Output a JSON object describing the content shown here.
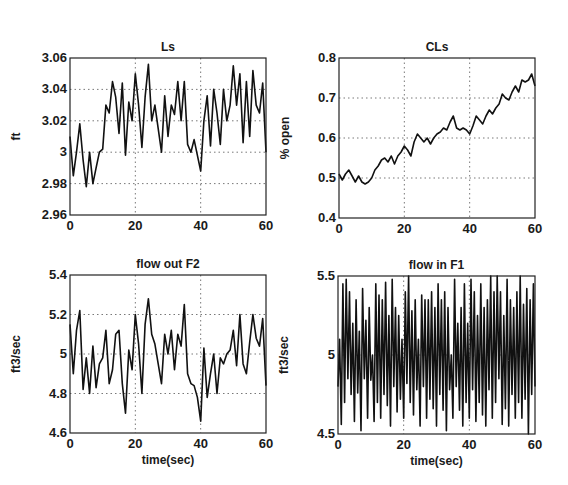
{
  "chart_data": [
    {
      "id": "ls",
      "type": "line",
      "title": "Ls",
      "xlabel": "",
      "ylabel": "ft",
      "xlim": [
        0,
        60
      ],
      "ylim": [
        2.96,
        3.06
      ],
      "xticks": [
        0,
        20,
        40,
        60
      ],
      "yticks": [
        2.96,
        2.98,
        3.0,
        3.02,
        3.04,
        3.06
      ],
      "ytick_labels": [
        "2.96",
        "2.98",
        "3",
        "3.02",
        "3.04",
        "3.06"
      ],
      "grid": true,
      "box": {
        "x": 70,
        "y": 58,
        "w": 196,
        "h": 157
      },
      "x": [
        0,
        1,
        2,
        3,
        4,
        5,
        6,
        7,
        8,
        9,
        10,
        11,
        12,
        13,
        14,
        15,
        16,
        17,
        18,
        19,
        20,
        21,
        22,
        23,
        24,
        25,
        26,
        27,
        28,
        29,
        30,
        31,
        32,
        33,
        34,
        35,
        36,
        37,
        38,
        39,
        40,
        41,
        42,
        43,
        44,
        45,
        46,
        47,
        48,
        49,
        50,
        51,
        52,
        53,
        54,
        55,
        56,
        57,
        58,
        59,
        60
      ],
      "series": [
        {
          "name": "Ls",
          "values": [
            3.01,
            2.985,
            3.0,
            3.018,
            2.995,
            2.978,
            3.0,
            2.98,
            2.99,
            3.0,
            3.002,
            3.03,
            3.025,
            3.045,
            3.035,
            3.012,
            3.044,
            2.998,
            3.032,
            3.02,
            3.05,
            3.03,
            3.003,
            3.035,
            3.056,
            3.02,
            3.03,
            3.015,
            3.0,
            3.036,
            3.01,
            3.03,
            3.024,
            3.045,
            3.02,
            3.045,
            3.005,
            3.0,
            3.008,
            2.998,
            2.988,
            3.02,
            3.036,
            3.004,
            3.04,
            3.025,
            3.005,
            3.04,
            3.02,
            3.03,
            3.055,
            3.03,
            3.05,
            3.006,
            3.045,
            3.01,
            3.052,
            3.03,
            3.025,
            3.044,
            3.0
          ]
        }
      ]
    },
    {
      "id": "cls",
      "type": "line",
      "title": "CLs",
      "xlabel": "",
      "ylabel": "% open",
      "xlim": [
        0,
        60
      ],
      "ylim": [
        0.4,
        0.8
      ],
      "xticks": [
        0,
        20,
        40,
        60
      ],
      "yticks": [
        0.4,
        0.5,
        0.6,
        0.7,
        0.8
      ],
      "ytick_labels": [
        "0.4",
        "0.5",
        "0.6",
        "0.7",
        "0.8"
      ],
      "grid": true,
      "box": {
        "x": 339,
        "y": 58,
        "w": 196,
        "h": 160
      },
      "x": [
        0,
        1,
        2,
        3,
        4,
        5,
        6,
        7,
        8,
        9,
        10,
        11,
        12,
        13,
        14,
        15,
        16,
        17,
        18,
        19,
        20,
        21,
        22,
        23,
        24,
        25,
        26,
        27,
        28,
        29,
        30,
        31,
        32,
        33,
        34,
        35,
        36,
        37,
        38,
        39,
        40,
        41,
        42,
        43,
        44,
        45,
        46,
        47,
        48,
        49,
        50,
        51,
        52,
        53,
        54,
        55,
        56,
        57,
        58,
        59,
        60
      ],
      "series": [
        {
          "name": "CLs",
          "values": [
            0.51,
            0.495,
            0.51,
            0.52,
            0.505,
            0.49,
            0.505,
            0.49,
            0.485,
            0.49,
            0.5,
            0.52,
            0.53,
            0.545,
            0.55,
            0.54,
            0.555,
            0.535,
            0.555,
            0.565,
            0.58,
            0.57,
            0.555,
            0.59,
            0.61,
            0.6,
            0.59,
            0.6,
            0.585,
            0.6,
            0.61,
            0.615,
            0.625,
            0.62,
            0.64,
            0.655,
            0.625,
            0.62,
            0.625,
            0.62,
            0.61,
            0.63,
            0.655,
            0.645,
            0.635,
            0.655,
            0.67,
            0.66,
            0.675,
            0.685,
            0.71,
            0.7,
            0.695,
            0.715,
            0.73,
            0.715,
            0.745,
            0.74,
            0.745,
            0.76,
            0.73
          ]
        }
      ]
    },
    {
      "id": "flow_out_f2",
      "type": "line",
      "title": "flow out F2",
      "xlabel": "time(sec)",
      "ylabel": "ft3/sec",
      "xlim": [
        0,
        60
      ],
      "ylim": [
        4.6,
        5.4
      ],
      "xticks": [
        0,
        20,
        40,
        60
      ],
      "yticks": [
        4.6,
        4.8,
        5.0,
        5.2,
        5.4
      ],
      "ytick_labels": [
        "4.6",
        "4.8",
        "5",
        "5.2",
        "5.4"
      ],
      "grid": true,
      "box": {
        "x": 70,
        "y": 275,
        "w": 196,
        "h": 158
      },
      "x": [
        0,
        1,
        2,
        3,
        4,
        5,
        6,
        7,
        8,
        9,
        10,
        11,
        12,
        13,
        14,
        15,
        16,
        17,
        18,
        19,
        20,
        21,
        22,
        23,
        24,
        25,
        26,
        27,
        28,
        29,
        30,
        31,
        32,
        33,
        34,
        35,
        36,
        37,
        38,
        39,
        40,
        41,
        42,
        43,
        44,
        45,
        46,
        47,
        48,
        49,
        50,
        51,
        52,
        53,
        54,
        55,
        56,
        57,
        58,
        59,
        60
      ],
      "series": [
        {
          "name": "flow out F2",
          "values": [
            5.15,
            4.9,
            5.12,
            5.22,
            4.82,
            4.98,
            4.8,
            5.04,
            4.83,
            4.95,
            4.98,
            5.12,
            4.85,
            4.92,
            5.1,
            5.12,
            4.85,
            4.7,
            5.02,
            4.92,
            5.2,
            5.05,
            4.8,
            5.15,
            5.28,
            5.1,
            5.05,
            4.95,
            4.85,
            5.1,
            5.0,
            5.12,
            4.92,
            5.1,
            5.04,
            5.25,
            4.9,
            4.85,
            4.84,
            4.78,
            4.66,
            5.03,
            4.78,
            4.9,
            5.0,
            4.8,
            4.98,
            4.95,
            5.0,
            5.02,
            5.12,
            4.94,
            5.2,
            4.95,
            4.9,
            5.06,
            5.2,
            5.08,
            5.04,
            5.18,
            4.84
          ]
        }
      ]
    },
    {
      "id": "flow_in_f1",
      "type": "line",
      "title": "flow in F1",
      "xlabel": "time(sec)",
      "ylabel": "ft3/sec",
      "xlim": [
        0,
        60
      ],
      "ylim": [
        4.5,
        5.5
      ],
      "xticks": [
        0,
        20,
        40,
        60
      ],
      "yticks": [
        4.5,
        5.0,
        5.5
      ],
      "ytick_labels": [
        "4.5",
        "5",
        "5.5"
      ],
      "grid": true,
      "box": {
        "x": 338,
        "y": 276,
        "w": 197,
        "h": 158
      },
      "x": [
        0,
        0.5,
        1,
        1.5,
        2,
        2.5,
        3,
        3.5,
        4,
        4.5,
        5,
        5.5,
        6,
        6.5,
        7,
        7.5,
        8,
        8.5,
        9,
        9.5,
        10,
        10.5,
        11,
        11.5,
        12,
        12.5,
        13,
        13.5,
        14,
        14.5,
        15,
        15.5,
        16,
        16.5,
        17,
        17.5,
        18,
        18.5,
        19,
        19.5,
        20,
        20.5,
        21,
        21.5,
        22,
        22.5,
        23,
        23.5,
        24,
        24.5,
        25,
        25.5,
        26,
        26.5,
        27,
        27.5,
        28,
        28.5,
        29,
        29.5,
        30,
        30.5,
        31,
        31.5,
        32,
        32.5,
        33,
        33.5,
        34,
        34.5,
        35,
        35.5,
        36,
        36.5,
        37,
        37.5,
        38,
        38.5,
        39,
        39.5,
        40,
        40.5,
        41,
        41.5,
        42,
        42.5,
        43,
        43.5,
        44,
        44.5,
        45,
        45.5,
        46,
        46.5,
        47,
        47.5,
        48,
        48.5,
        49,
        49.5,
        50,
        50.5,
        51,
        51.5,
        52,
        52.5,
        53,
        53.5,
        54,
        54.5,
        55,
        55.5,
        56,
        56.5,
        57,
        57.5,
        58,
        58.5,
        59,
        59.5,
        60
      ],
      "series": [
        {
          "name": "flow in F1",
          "values": [
            4.8,
            5.1,
            4.56,
            5.45,
            4.7,
            5.48,
            4.85,
            5.4,
            4.75,
            5.2,
            4.58,
            5.35,
            4.76,
            5.15,
            4.52,
            5.42,
            4.85,
            5.22,
            4.6,
            5.3,
            4.84,
            5.0,
            4.58,
            5.45,
            4.7,
            5.38,
            4.6,
            5.35,
            4.75,
            5.46,
            4.68,
            5.25,
            4.55,
            5.48,
            4.8,
            5.3,
            4.64,
            5.25,
            4.72,
            5.1,
            4.6,
            5.4,
            4.82,
            5.52,
            4.7,
            5.28,
            4.62,
            5.35,
            4.78,
            5.1,
            4.55,
            5.38,
            4.8,
            5.35,
            4.6,
            5.35,
            4.72,
            5.4,
            4.66,
            5.3,
            4.55,
            5.45,
            4.75,
            5.35,
            4.65,
            5.4,
            4.52,
            5.3,
            4.78,
            5.0,
            4.6,
            5.48,
            4.8,
            5.2,
            4.65,
            5.3,
            4.55,
            5.45,
            4.7,
            5.2,
            4.6,
            5.48,
            4.78,
            5.4,
            4.58,
            5.25,
            4.7,
            5.45,
            4.62,
            5.3,
            4.55,
            5.35,
            4.78,
            5.5,
            4.6,
            5.4,
            4.7,
            5.5,
            4.85,
            5.4,
            4.56,
            5.25,
            4.66,
            5.48,
            4.55,
            5.35,
            4.75,
            5.3,
            4.6,
            5.4,
            4.7,
            5.5,
            4.6,
            5.32,
            4.72,
            5.42,
            4.5,
            5.35,
            4.75,
            5.45,
            4.8
          ]
        }
      ]
    }
  ]
}
